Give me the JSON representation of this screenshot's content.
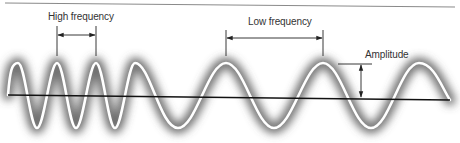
{
  "diagram": {
    "labels": {
      "high_frequency": "High frequency",
      "low_frequency": "Low frequency",
      "amplitude": "Amplitude"
    },
    "colors": {
      "background": "#ffffff",
      "wave_stroke": "#ffffff",
      "wave_glow": "#555555",
      "baseline": "#111111",
      "annotation": "#222222",
      "top_rule": "#8a8a8a",
      "label_text": "#333333"
    },
    "wave": {
      "high_frequency_peaks_x": [
        18,
        57,
        96,
        135
      ],
      "low_frequency_peaks_x": [
        226,
        323,
        419
      ],
      "peak_y": 63,
      "trough_y": 128
    },
    "annotations": {
      "high_frequency_span": [
        57,
        96
      ],
      "low_frequency_span": [
        226,
        323
      ],
      "amplitude_span_y": [
        64,
        97
      ]
    }
  }
}
